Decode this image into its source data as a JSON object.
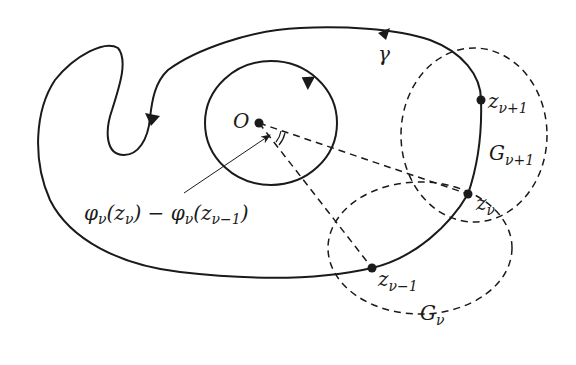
{
  "diagram": {
    "type": "complex-analysis-path-figure",
    "labels": {
      "origin": "O",
      "curve": "γ",
      "z_next": {
        "base": "z",
        "sub": "ν+1"
      },
      "z_cur": {
        "base": "z",
        "sub": "ν"
      },
      "z_prev": {
        "base": "z",
        "sub": "ν−1"
      },
      "G_next": {
        "base": "G",
        "sub": "ν+1"
      },
      "G_cur": {
        "base": "G",
        "sub": "ν"
      },
      "angle_annotation": "φν(zν) − φν(zν−1)"
    },
    "angle_annotation_parts": {
      "phi1": "φ",
      "s1": "ν",
      "open1": "(z",
      "s2": "ν",
      "close1": ")",
      "minus": " − ",
      "phi2": "φ",
      "s3": "ν",
      "open2": "(z",
      "s4": "ν−1",
      "close2": ")"
    },
    "points": [
      {
        "name": "O",
        "x": 259,
        "y": 123
      },
      {
        "name": "z_nu_plus_1",
        "x": 481,
        "y": 100
      },
      {
        "name": "z_nu",
        "x": 468,
        "y": 194
      },
      {
        "name": "z_nu_minus_1",
        "x": 372,
        "y": 268
      }
    ],
    "stroke_color": "#1a1a1a",
    "background": "#ffffff"
  }
}
